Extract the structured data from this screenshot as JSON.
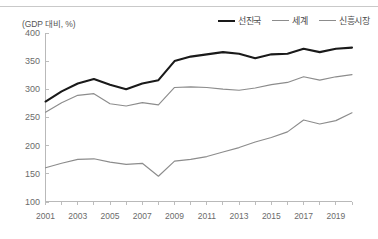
{
  "figure": {
    "unit_label": "(GDP 대비, %)"
  },
  "legend": {
    "position": "top-right",
    "items": [
      {
        "label": "선진국",
        "color": "#1a1a1a",
        "width": 2.1
      },
      {
        "label": "세계",
        "color": "#8c8c8c",
        "width": 1.2
      },
      {
        "label": "신흥시장",
        "color": "#8c8c8c",
        "width": 1.2
      }
    ]
  },
  "axes": {
    "y_ticks": [
      "100",
      "150",
      "200",
      "250",
      "300",
      "350",
      "400"
    ],
    "x_ticks": [
      "2001",
      "2003",
      "2005",
      "2007",
      "2009",
      "2011",
      "2013",
      "2015",
      "2017",
      "2019"
    ]
  },
  "chart_data": {
    "type": "line",
    "title": "",
    "subtitle": "",
    "xlabel": "",
    "ylabel": "(GDP 대비, %)",
    "ylim": [
      100,
      400
    ],
    "xlim": [
      2001,
      2020
    ],
    "grid": false,
    "legend_position": "top-right",
    "x": [
      2001,
      2002,
      2003,
      2004,
      2005,
      2006,
      2007,
      2008,
      2009,
      2010,
      2011,
      2012,
      2013,
      2014,
      2015,
      2016,
      2017,
      2018,
      2019,
      2020
    ],
    "x_tick_labels": [
      "2001",
      "2003",
      "2005",
      "2007",
      "2009",
      "2011",
      "2013",
      "2015",
      "2017",
      "2019"
    ],
    "y_ticks": [
      100,
      150,
      200,
      250,
      300,
      350,
      400
    ],
    "series": [
      {
        "name": "선진국",
        "color": "#1a1a1a",
        "values": [
          278,
          296,
          310,
          318,
          308,
          300,
          310,
          316,
          350,
          358,
          362,
          366,
          363,
          355,
          362,
          363,
          372,
          366,
          372,
          374
        ]
      },
      {
        "name": "세계",
        "color": "#8c8c8c",
        "values": [
          259,
          276,
          289,
          292,
          274,
          270,
          276,
          272,
          303,
          304,
          303,
          300,
          298,
          302,
          308,
          312,
          322,
          316,
          322,
          326
        ]
      },
      {
        "name": "신흥시장",
        "color": "#8c8c8c",
        "values": [
          160,
          168,
          175,
          176,
          170,
          166,
          168,
          145,
          172,
          175,
          180,
          188,
          196,
          206,
          214,
          224,
          245,
          238,
          244,
          258
        ]
      }
    ]
  }
}
